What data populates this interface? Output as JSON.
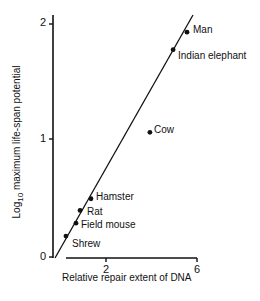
{
  "chart_data": {
    "type": "scatter",
    "title": "",
    "xlabel": "Relative repair extent of DNA",
    "ylabel_prefix": "Log",
    "ylabel_sub": "10",
    "ylabel_rest": " maximum life-span potential",
    "ylabel": "Log10 maximum life-span potential",
    "xlim": [
      0,
      6.2
    ],
    "ylim": [
      0,
      2.1
    ],
    "xticks": [
      2,
      6
    ],
    "yticks": [
      0,
      1,
      2
    ],
    "grid": false,
    "legend": "none",
    "points": [
      {
        "label": "Shrew",
        "x": 0.24,
        "y": 0.18
      },
      {
        "label": "Field mouse",
        "x": 0.68,
        "y": 0.29
      },
      {
        "label": "Rat",
        "x": 0.86,
        "y": 0.4
      },
      {
        "label": "Hamster",
        "x": 1.34,
        "y": 0.5
      },
      {
        "label": "Cow",
        "x": 3.93,
        "y": 1.07
      },
      {
        "label": "Indian elephant",
        "x": 4.95,
        "y": 1.78
      },
      {
        "label": "Man",
        "x": 5.56,
        "y": 1.93
      }
    ],
    "fit_line": {
      "x0": -0.2,
      "y0": 0.0,
      "x1": 5.8,
      "y1": 2.07
    }
  },
  "axis": {
    "ytick_0": "0",
    "ytick_1": "1",
    "ytick_2": "2",
    "xtick_2": "2",
    "xtick_6": "6"
  }
}
